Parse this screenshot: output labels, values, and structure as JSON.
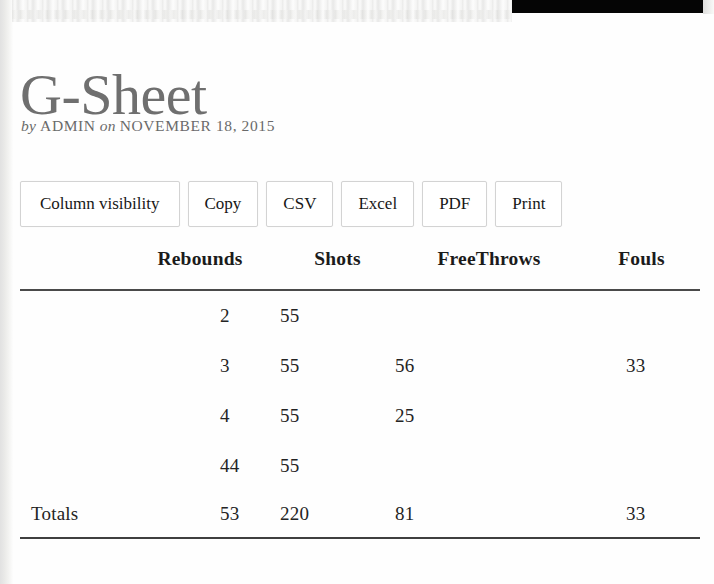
{
  "post": {
    "title": "G-Sheet",
    "meta": {
      "by_word": "by",
      "author": "ADMIN",
      "on_word": "on",
      "date": "NOVEMBER 18, 2015"
    }
  },
  "toolbar": {
    "buttons": [
      {
        "label": "Column visibility",
        "name": "column-visibility-button"
      },
      {
        "label": "Copy",
        "name": "copy-button"
      },
      {
        "label": "CSV",
        "name": "csv-button"
      },
      {
        "label": "Excel",
        "name": "excel-button"
      },
      {
        "label": "PDF",
        "name": "pdf-button"
      },
      {
        "label": "Print",
        "name": "print-button"
      }
    ]
  },
  "table": {
    "headers": [
      "",
      "Rebounds",
      "Shots",
      "FreeThrows",
      "Fouls"
    ],
    "rows": [
      {
        "label": "",
        "rebounds": "2",
        "shots": "55",
        "freethrows": "",
        "fouls": ""
      },
      {
        "label": "",
        "rebounds": "3",
        "shots": "55",
        "freethrows": "56",
        "fouls": "33"
      },
      {
        "label": "",
        "rebounds": "4",
        "shots": "55",
        "freethrows": "25",
        "fouls": ""
      },
      {
        "label": "",
        "rebounds": "44",
        "shots": "55",
        "freethrows": "",
        "fouls": ""
      }
    ],
    "footer": {
      "label": "Totals",
      "rebounds": "53",
      "shots": "220",
      "freethrows": "81",
      "fouls": "33"
    }
  },
  "colors": {
    "title": "#6f6f6f",
    "text": "#1a1a1a",
    "rule": "#4a4a4a",
    "button_border": "#d3d3d3",
    "redaction_bar": "#050505"
  }
}
